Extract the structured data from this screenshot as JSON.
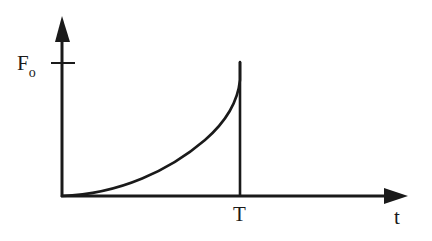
{
  "diagram": {
    "type": "force-time pulse graph",
    "y_axis": {
      "label": "",
      "tick_label_main": "F",
      "tick_label_sub": "o"
    },
    "x_axis": {
      "label": "t",
      "tick_label": "T"
    },
    "curve": {
      "description": "Force rises from zero at t=0 in a concave-up curve, reaching F_o at t=T, then drops vertically to zero",
      "start": [
        0,
        0
      ],
      "end": [
        "T",
        "F_o"
      ]
    },
    "colors": {
      "stroke": "#1a1a1a",
      "background": "#ffffff"
    }
  }
}
